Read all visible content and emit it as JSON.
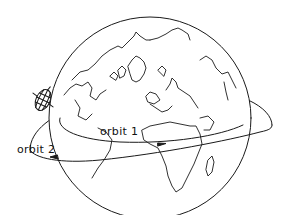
{
  "diagram": {
    "colors": {
      "line": "#1a1a1a",
      "background": "#ffffff"
    },
    "labels": {
      "orbit1": "orbit 1",
      "orbit2": "orbit 2"
    },
    "elements": [
      {
        "id": "globe",
        "kind": "circle",
        "description": "Earth globe showing Arctic, Europe, Africa, Greenland"
      },
      {
        "id": "orbit1",
        "kind": "ellipse",
        "description": "inner orbit crossing globe with arrow pointing right"
      },
      {
        "id": "orbit2",
        "kind": "ellipse",
        "description": "outer orbit with arrow pointing left, carries satellite"
      },
      {
        "id": "satellite",
        "kind": "gridded sphere",
        "description": "satellite on orbit 2 at left side"
      }
    ]
  }
}
